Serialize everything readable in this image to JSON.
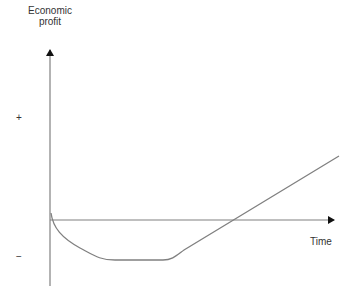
{
  "diagram": {
    "y_axis_label_line1": "Economic",
    "y_axis_label_line2": "profit",
    "x_axis_label": "Time",
    "positive_marker": "+",
    "negative_marker": "−",
    "line_color": "#808080",
    "curve_description": "Economic profit starts at zero, falls into losses, stays flat negative, then rises linearly crossing zero and becoming positive over time"
  }
}
